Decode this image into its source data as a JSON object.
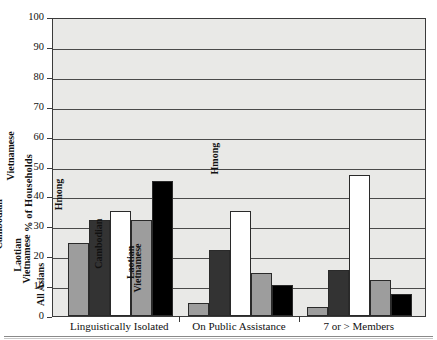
{
  "chart_data": {
    "type": "bar",
    "title": "",
    "xlabel": "",
    "ylabel": "% of Households",
    "ylim": [
      0,
      100
    ],
    "yticks": [
      0,
      10,
      20,
      30,
      40,
      50,
      60,
      70,
      80,
      90,
      100
    ],
    "grid": true,
    "legend": "none",
    "categories": [
      "Linguistically Isolated",
      "On Public Assistance",
      "7 or > Members"
    ],
    "series": [
      {
        "name": "All Asians",
        "color": "#9d9d9d",
        "values": [
          24.5,
          4.5,
          3.0
        ]
      },
      {
        "name": "Cambodian",
        "color": "#333333",
        "values": [
          32.0,
          22.0,
          15.5
        ]
      },
      {
        "name": "Hmong",
        "color": "#ffffff",
        "values": [
          35.0,
          35.0,
          47.0
        ]
      },
      {
        "name": "Laotian",
        "color": "#9d9d9d",
        "values": [
          32.0,
          14.5,
          12.0
        ]
      },
      {
        "name": "Vietnamese",
        "color": "#000000",
        "values": [
          45.0,
          10.5,
          7.5
        ]
      }
    ],
    "bar_labels": [
      [
        "All Asians",
        "Cambodian",
        "Hmong",
        "Laotian",
        "Vietnamese"
      ],
      [
        "All Asians",
        "Cambodian",
        "Hmong",
        "Laotian",
        "Vietnamese"
      ],
      [
        "All Asians",
        "Cambodian",
        "Hmong",
        "Laotian",
        "Vietnamese"
      ]
    ]
  },
  "figure": {
    "plot_background": "#e9e9e7",
    "axis_color": "#3b3b3b"
  }
}
